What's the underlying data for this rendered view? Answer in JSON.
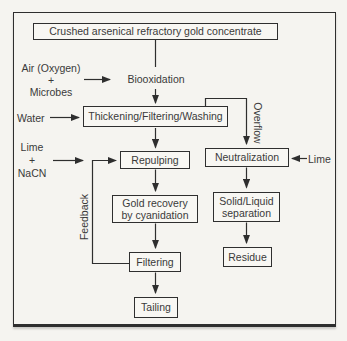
{
  "colors": {
    "background": "#f5f4f0",
    "line": "#2e2e2e",
    "text": "#3a3a3a",
    "box_fill": "#f8f7f3"
  },
  "flowchart": {
    "feed": "Crushed arsenical refractory gold concentrate",
    "air_input": [
      "Air (Oxygen)",
      "+",
      "Microbes"
    ],
    "biooxidation": "Biooxidation",
    "water_input": "Water",
    "thickening": "Thickening/Filtering/Washing",
    "overflow_label": "Overflow",
    "lime_nacn_input": [
      "Lime",
      "+",
      "NaCN"
    ],
    "repulping": "Repulping",
    "neutralization": "Neutralization",
    "lime_input": "Lime",
    "feedback_label": "Feedback",
    "gold_recovery": [
      "Gold recovery",
      "by cyanidation"
    ],
    "solid_liquid": [
      "Solid/Liquid",
      "separation"
    ],
    "filtering": "Filtering",
    "residue": "Residue",
    "tailing": "Tailing"
  }
}
